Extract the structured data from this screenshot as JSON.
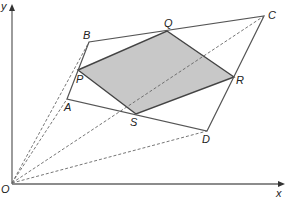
{
  "figure": {
    "type": "geometry-diagram",
    "colors": {
      "line": "#555555",
      "shade": "#c8c8c8",
      "axis": "#666666"
    },
    "axes": {
      "x_label": "x",
      "y_label": "y",
      "origin_label": "O"
    },
    "points": [
      {
        "name": "A",
        "x": 67,
        "y": 99
      },
      {
        "name": "B",
        "x": 89,
        "y": 42
      },
      {
        "name": "C",
        "x": 264,
        "y": 16
      },
      {
        "name": "D",
        "x": 207,
        "y": 131
      },
      {
        "name": "P",
        "x": 78,
        "y": 70
      },
      {
        "name": "Q",
        "x": 167,
        "y": 31
      },
      {
        "name": "R",
        "x": 234,
        "y": 77
      },
      {
        "name": "S",
        "x": 136,
        "y": 114
      }
    ],
    "labels": {
      "A": "A",
      "B": "B",
      "C": "C",
      "D": "D",
      "P": "P",
      "Q": "Q",
      "R": "R",
      "S": "S",
      "O": "O",
      "x": "x",
      "y": "y"
    }
  }
}
